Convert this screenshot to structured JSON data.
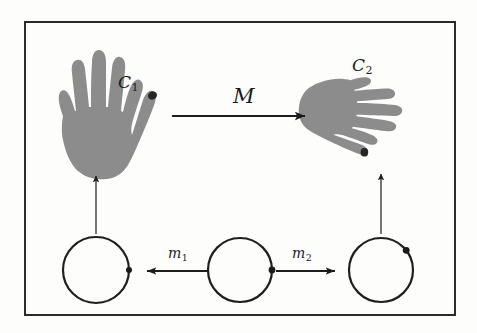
{
  "figure": {
    "type": "commutative-diagram",
    "caption_visible": false,
    "background_color": "#fdfdfc",
    "frame": {
      "stroke_color": "#2a2a2a",
      "stroke_width": 2,
      "x": 25,
      "y": 22,
      "width": 430,
      "height": 293
    },
    "labels": {
      "transform_top": "M",
      "hand_left": "C",
      "hand_left_subscript": "1",
      "hand_right": "C",
      "hand_right_subscript": "2",
      "morphism_left": "m",
      "morphism_left_subscript": "1",
      "morphism_right": "m",
      "morphism_right_subscript": "2"
    },
    "hands": {
      "fill_color": "#8c8c8c",
      "marker_color": "#262626",
      "left": {
        "name": "left-hand-open-palm",
        "orientation": "fingers-up-thumb-right",
        "marker_position": "thumb-tip"
      },
      "right": {
        "name": "right-hand-rotated",
        "orientation": "fingers-left-thumb-up",
        "marker_position": "thumb-tip"
      }
    },
    "circles": {
      "stroke_color": "#1f1f1f",
      "stroke_width": 2.2,
      "marker_color": "#1a1a1a",
      "items": [
        {
          "name": "circle-left",
          "cx": 96,
          "cy": 270,
          "r": 33,
          "marker_angle_deg": 0
        },
        {
          "name": "circle-middle",
          "cx": 240,
          "cy": 270,
          "r": 32,
          "marker_angle_deg": 0
        },
        {
          "name": "circle-right",
          "cx": 381,
          "cy": 270,
          "r": 32,
          "marker_angle_deg": -52
        }
      ]
    },
    "arrows": {
      "stroke_color": "#1c1c1c",
      "items": [
        {
          "name": "arrow-M",
          "direction": "right",
          "x1": 172,
          "y1": 116,
          "x2": 311,
          "y2": 116,
          "width": 2.0,
          "head": 9
        },
        {
          "name": "arrow-m1",
          "direction": "left",
          "x1": 207,
          "y1": 271,
          "x2": 141,
          "y2": 271,
          "width": 2.0,
          "head": 8
        },
        {
          "name": "arrow-m2",
          "direction": "right",
          "x1": 276,
          "y1": 271,
          "x2": 341,
          "y2": 271,
          "width": 2.0,
          "head": 8
        },
        {
          "name": "arrow-vertical-left",
          "direction": "up",
          "x1": 96,
          "y1": 234,
          "x2": 96,
          "y2": 172,
          "width": 1.2,
          "head": 5
        },
        {
          "name": "arrow-vertical-right",
          "direction": "up",
          "x1": 381,
          "y1": 234,
          "x2": 381,
          "y2": 170,
          "width": 1.2,
          "head": 5
        }
      ]
    }
  }
}
